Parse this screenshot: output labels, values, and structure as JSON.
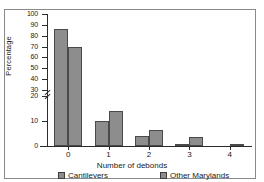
{
  "chart_data": {
    "type": "bar",
    "title": "",
    "xlabel": "Number of debonds",
    "ylabel": "Percentage",
    "categories": [
      "0",
      "1",
      "2",
      "3",
      "4"
    ],
    "series": [
      {
        "name": "Cantilevers",
        "values": [
          86,
          10,
          4,
          1,
          0
        ]
      },
      {
        "name": "Other Marylands",
        "values": [
          70,
          14,
          6.5,
          3.5,
          1
        ]
      }
    ],
    "ylim": [
      0,
      100
    ],
    "yticks": [
      0,
      10,
      20,
      30,
      40,
      50,
      60,
      70,
      80,
      90,
      100
    ],
    "ytick_labels": [
      "0",
      "10",
      "20",
      "30",
      "40",
      "50",
      "60",
      "70",
      "80",
      "90",
      "100"
    ],
    "axis_break": {
      "between": [
        20,
        30
      ],
      "present": true
    },
    "grid": false,
    "legend_position": "bottom",
    "bar_color": "#8d8d8d",
    "bar_edge_color": "#4a4a4a",
    "axis_color": "#2b2b2b"
  },
  "axes": {
    "y_title": "Percentage",
    "x_title": "Number of debonds"
  },
  "legend": {
    "items": [
      {
        "label": "Cantilevers"
      },
      {
        "label": "Other Marylands"
      }
    ]
  }
}
